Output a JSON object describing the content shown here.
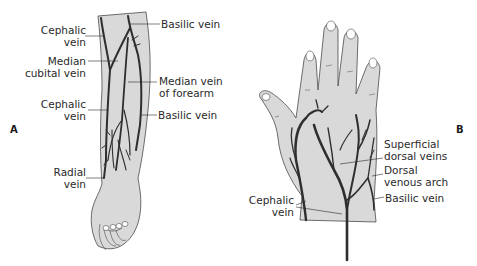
{
  "figure": {
    "panel_a": {
      "letter": "A",
      "labels": {
        "cephalic_vein_upper": [
          "Cephalic",
          "vein"
        ],
        "basilic_vein_upper": "Basilic vein",
        "median_cubital_vein": [
          "Median",
          "cubital vein"
        ],
        "median_vein_of_forearm": [
          "Median vein",
          "of forearm"
        ],
        "cephalic_vein_lower": [
          "Cephalic",
          "vein"
        ],
        "basilic_vein_lower": "Basilic vein",
        "radial_vein": [
          "Radial",
          "vein"
        ]
      }
    },
    "panel_b": {
      "letter": "B",
      "labels": {
        "superficial_dorsal_veins": [
          "Superficial",
          "dorsal veins"
        ],
        "dorsal_venous_arch": [
          "Dorsal",
          "venous arch"
        ],
        "basilic_vein": "Basilic vein",
        "cephalic_vein": [
          "Cephalic",
          "vein"
        ]
      }
    },
    "colors": {
      "skin": "#d9d9d9",
      "outline": "#4a4a4a",
      "vein": "#2e2e2e",
      "text": "#2a2a2a",
      "background": "#ffffff"
    }
  }
}
